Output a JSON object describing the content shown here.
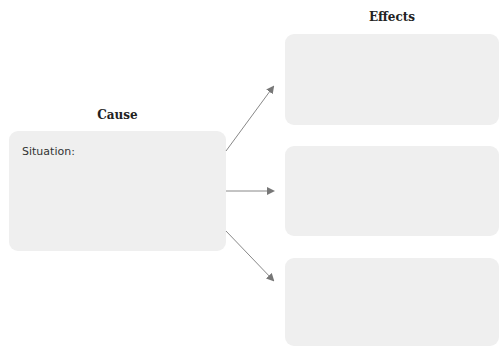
{
  "diagram": {
    "cause": {
      "heading": "Cause",
      "box_label": "Situation:",
      "fill": "#efefef"
    },
    "effects": {
      "heading": "Effects",
      "boxes": [
        {
          "label": ""
        },
        {
          "label": ""
        },
        {
          "label": ""
        }
      ]
    },
    "arrows": [
      {
        "from": "cause",
        "to": "effect-1"
      },
      {
        "from": "cause",
        "to": "effect-2"
      },
      {
        "from": "cause",
        "to": "effect-3"
      }
    ],
    "arrow_color": "#777777"
  }
}
